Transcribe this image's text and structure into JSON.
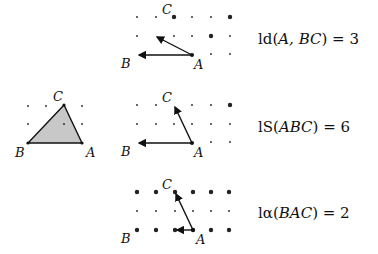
{
  "panels": [
    {
      "id": "top",
      "formula": {
        "fn": "ld",
        "args": "A, BC",
        "value": "3"
      },
      "points": {
        "A": [
          192,
          55
        ],
        "B": [
          137,
          55
        ],
        "C": [
          174,
          17
        ]
      },
      "labels": [
        {
          "text": "C",
          "x": 162,
          "y": 14
        },
        {
          "text": "B",
          "x": 121,
          "y": 68
        },
        {
          "text": "A",
          "x": 194,
          "y": 69
        }
      ]
    },
    {
      "id": "middle",
      "formula": {
        "fn": "lS",
        "args": "ABC",
        "value": "6"
      },
      "points": {
        "A": [
          192,
          143
        ],
        "B": [
          137,
          143
        ],
        "C": [
          174,
          105
        ]
      },
      "labels": [
        {
          "text": "C",
          "x": 162,
          "y": 102
        },
        {
          "text": "B",
          "x": 121,
          "y": 156
        },
        {
          "text": "A",
          "x": 194,
          "y": 157
        }
      ]
    },
    {
      "id": "bottom",
      "formula": {
        "fn": "lα",
        "args": "BAC",
        "value": "2"
      },
      "points": {
        "A": [
          193,
          230
        ],
        "B": [
          137,
          230
        ],
        "C": [
          175,
          192
        ]
      },
      "labels": [
        {
          "text": "C",
          "x": 162,
          "y": 189
        },
        {
          "text": "B",
          "x": 121,
          "y": 243
        },
        {
          "text": "A",
          "x": 196,
          "y": 244
        }
      ]
    },
    {
      "id": "triangle",
      "points": {
        "A": [
          82,
          143
        ],
        "B": [
          28,
          143
        ],
        "C": [
          64,
          105
        ]
      },
      "labels": [
        {
          "text": "C",
          "x": 53,
          "y": 101
        },
        {
          "text": "B",
          "x": 15,
          "y": 157
        },
        {
          "text": "A",
          "x": 86,
          "y": 157
        }
      ]
    }
  ],
  "formulas": [
    {
      "name": "ld",
      "text_fn": "ld(",
      "arg": "A, BC",
      "close": ") = 3"
    },
    {
      "name": "lS",
      "text_fn": "lS(",
      "arg": "ABC",
      "close": ") = 6"
    },
    {
      "name": "lalpha",
      "text_fn": "lα(",
      "arg": "BAC",
      "close": ") = 2"
    }
  ],
  "colors": {
    "stroke": "#111111",
    "fill": "#c8c8c8",
    "dot": "#222222"
  }
}
